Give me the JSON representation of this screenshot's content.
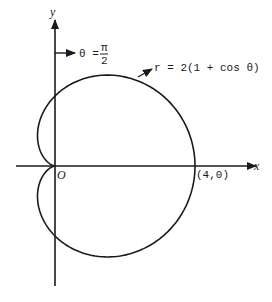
{
  "diagram": {
    "axes": {
      "x_label": "x",
      "y_label": "y",
      "origin_label": "O"
    },
    "annotations": {
      "theta_label": "θ =",
      "theta_num": "π",
      "theta_den": "2",
      "equation": "r = 2(1 + cos θ)",
      "point_label": "(4,0)"
    },
    "colors": {
      "stroke": "#1a1a1a",
      "background": "#ffffff"
    }
  }
}
